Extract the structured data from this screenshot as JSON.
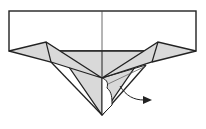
{
  "diagram": {
    "type": "origami-folding-step",
    "colors": {
      "paper_front": "#ffffff",
      "paper_back": "#d9d9d9",
      "line": "#222222",
      "arrow": "#222222"
    },
    "elements": [
      {
        "name": "paper-rectangle",
        "kind": "white-face"
      },
      {
        "name": "center-crease",
        "kind": "crease-line"
      },
      {
        "name": "left-wing-flap",
        "kind": "shaded-face"
      },
      {
        "name": "right-wing-flap",
        "kind": "shaded-face"
      },
      {
        "name": "center-point-flap",
        "kind": "shaded-face"
      },
      {
        "name": "fold-arrow",
        "kind": "arrow",
        "direction": "down-right"
      }
    ]
  }
}
